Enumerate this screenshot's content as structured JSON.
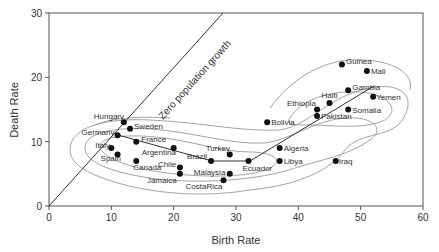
{
  "chart_data": {
    "type": "scatter",
    "title": "",
    "xlabel": "Birth Rate",
    "ylabel": "Death Rate",
    "xlim": [
      0,
      60
    ],
    "ylim": [
      0,
      30
    ],
    "xticks": [
      0,
      10,
      20,
      30,
      40,
      50,
      60
    ],
    "yticks": [
      0,
      10,
      20,
      30
    ],
    "grid": false,
    "legend": null,
    "annotations": [
      {
        "text": "Zero population growth",
        "type": "reference-line",
        "from": [
          0,
          0
        ],
        "to": [
          28,
          30
        ]
      }
    ],
    "trend_line": [
      [
        11,
        11
      ],
      [
        26,
        7
      ],
      [
        32,
        7
      ],
      [
        52,
        19
      ]
    ],
    "points": [
      {
        "label": "Hungary",
        "x": 12,
        "y": 13
      },
      {
        "label": "Sweden",
        "x": 13,
        "y": 12
      },
      {
        "label": "Germany",
        "x": 11,
        "y": 11
      },
      {
        "label": "France",
        "x": 14,
        "y": 10
      },
      {
        "label": "Italy",
        "x": 10,
        "y": 9
      },
      {
        "label": "Spain",
        "x": 11,
        "y": 8
      },
      {
        "label": "Canada",
        "x": 14,
        "y": 7
      },
      {
        "label": "Argentina",
        "x": 20,
        "y": 9
      },
      {
        "label": "Chile",
        "x": 21,
        "y": 6
      },
      {
        "label": "Jamaica",
        "x": 21,
        "y": 5
      },
      {
        "label": "Brazil",
        "x": 26,
        "y": 7
      },
      {
        "label": "Turkey",
        "x": 29,
        "y": 8
      },
      {
        "label": "Malaysia",
        "x": 29,
        "y": 5
      },
      {
        "label": "CostaRica",
        "x": 28,
        "y": 4
      },
      {
        "label": "Ecuador",
        "x": 32,
        "y": 7
      },
      {
        "label": "Bolivia",
        "x": 35,
        "y": 13
      },
      {
        "label": "Algeria",
        "x": 37,
        "y": 9
      },
      {
        "label": "Libya",
        "x": 37,
        "y": 7
      },
      {
        "label": "Iraq",
        "x": 46,
        "y": 7
      },
      {
        "label": "Ethiopia",
        "x": 43,
        "y": 15
      },
      {
        "label": "Pakistan",
        "x": 43,
        "y": 14
      },
      {
        "label": "Haiti",
        "x": 45,
        "y": 16
      },
      {
        "label": "Gambia",
        "x": 48,
        "y": 18
      },
      {
        "label": "Somalia",
        "x": 48,
        "y": 15
      },
      {
        "label": "Yemen",
        "x": 52,
        "y": 17
      },
      {
        "label": "Guinea",
        "x": 47,
        "y": 22
      },
      {
        "label": "Mali",
        "x": 51,
        "y": 21
      }
    ]
  }
}
